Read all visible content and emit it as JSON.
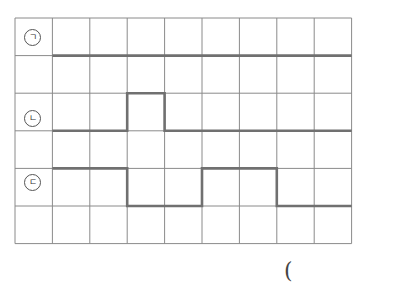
{
  "grid": {
    "cols": 9,
    "rows": 6,
    "left": 15,
    "top": 18,
    "cell_w": 37.4,
    "cell_h": 37.6,
    "line_color": "#8a8a8a",
    "path_color": "#707070"
  },
  "figures": [
    {
      "label": "ㄱ",
      "row": 0,
      "path": [
        [
          1,
          1
        ],
        [
          9,
          1
        ]
      ]
    },
    {
      "label": "ㄴ",
      "row": 2,
      "path": [
        [
          1,
          3
        ],
        [
          3,
          3
        ],
        [
          3,
          2
        ],
        [
          4,
          2
        ],
        [
          4,
          3
        ],
        [
          9,
          3
        ]
      ]
    },
    {
      "label": "ㄷ",
      "row": 4,
      "path": [
        [
          1,
          4
        ],
        [
          3,
          4
        ],
        [
          3,
          5
        ],
        [
          5,
          5
        ],
        [
          5,
          4
        ],
        [
          7,
          4
        ],
        [
          7,
          5
        ],
        [
          9,
          5
        ]
      ]
    }
  ],
  "answer_paren": "("
}
